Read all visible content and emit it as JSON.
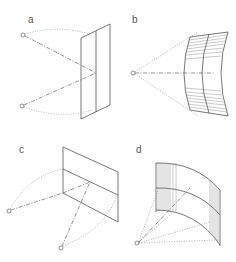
{
  "figure": {
    "panels": [
      {
        "id": "a",
        "label": "a",
        "description": "Two point sources reflecting off a flat vertical panel"
      },
      {
        "id": "b",
        "label": "b",
        "description": "Single point source facing a concave cylindrical surface (top view)"
      },
      {
        "id": "c",
        "label": "c",
        "description": "Two point sources below a flat tilted panel"
      },
      {
        "id": "d",
        "label": "d",
        "description": "Single point source below a curved cylindrical surface"
      }
    ],
    "colors": {
      "line": "#555555",
      "background": "#ffffff"
    }
  }
}
